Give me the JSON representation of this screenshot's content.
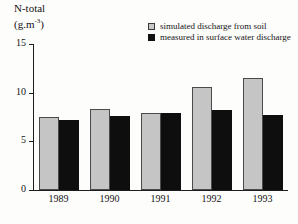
{
  "chart_data": {
    "type": "bar",
    "title": "N-total (g.m-3)",
    "title_main": "N-total",
    "title_unit_base": "(g.m",
    "title_unit_exp": "-3",
    "title_unit_close": ")",
    "xlabel": "",
    "ylabel": "N-total (g.m-3)",
    "categories": [
      "1989",
      "1990",
      "1991",
      "1992",
      "1993"
    ],
    "series": [
      {
        "name": "simulated discharge from soil",
        "color": "#c5c5c5",
        "values": [
          7.5,
          8.3,
          7.9,
          10.6,
          11.5
        ]
      },
      {
        "name": "measured in surface water discharge",
        "color": "#0e0e0e",
        "values": [
          7.2,
          7.6,
          7.9,
          8.2,
          7.7
        ]
      }
    ],
    "ylim": [
      0,
      15
    ],
    "yticks": [
      0,
      5,
      10,
      15
    ],
    "ytick_labels": [
      "0",
      "5",
      "10",
      "15"
    ],
    "grid": false,
    "legend_position": "top-right"
  },
  "legend": {
    "items": [
      {
        "label": "simulated discharge from soil",
        "swatch": "gray-square-swatch"
      },
      {
        "label": "measured in surface water discharge",
        "swatch": "black-square-swatch"
      }
    ]
  }
}
